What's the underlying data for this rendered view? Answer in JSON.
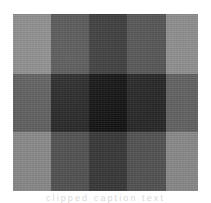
{
  "figure": {
    "kind": "texture-swatch",
    "background_color": "#ffffff",
    "caption_remnant": "clipped caption text"
  },
  "swatch": {
    "columns": 5,
    "rows": 3,
    "column_bands": [
      "light",
      "dark",
      "darkest",
      "dark",
      "light"
    ],
    "row_bands": [
      "light",
      "dark",
      "light"
    ],
    "palette": {
      "light_light": "#8e8e8e",
      "light_dark": "#565656",
      "light_darkest": "#3b3b3b",
      "dark_light": "#5e5e5e",
      "dark_dark": "#262626",
      "dark_darkest": "#111111",
      "edge": "#9a9a9a"
    },
    "cells": [
      [
        {
          "id": "r1c1",
          "color": "#8d8d8d",
          "band": "light-light"
        },
        {
          "id": "r1c2",
          "color": "#555555",
          "band": "light-dark"
        },
        {
          "id": "r1c3",
          "color": "#3a3a3a",
          "band": "light-darkest"
        },
        {
          "id": "r1c4",
          "color": "#565656",
          "band": "light-dark"
        },
        {
          "id": "r1c5",
          "color": "#909090",
          "band": "light-light"
        }
      ],
      [
        {
          "id": "r2c1",
          "color": "#5e5e5e",
          "band": "dark-light"
        },
        {
          "id": "r2c2",
          "color": "#252525",
          "band": "dark-dark"
        },
        {
          "id": "r2c3",
          "color": "#101010",
          "band": "dark-darkest"
        },
        {
          "id": "r2c4",
          "color": "#272727",
          "band": "dark-dark"
        },
        {
          "id": "r2c5",
          "color": "#636363",
          "band": "dark-light"
        }
      ],
      [
        {
          "id": "r3c1",
          "color": "#8a8a8a",
          "band": "light-light"
        },
        {
          "id": "r3c2",
          "color": "#525252",
          "band": "light-dark"
        },
        {
          "id": "r3c3",
          "color": "#383838",
          "band": "light-darkest"
        },
        {
          "id": "r3c4",
          "color": "#535353",
          "band": "light-dark"
        },
        {
          "id": "r3c5",
          "color": "#8c8c8c",
          "band": "light-light"
        }
      ]
    ]
  }
}
